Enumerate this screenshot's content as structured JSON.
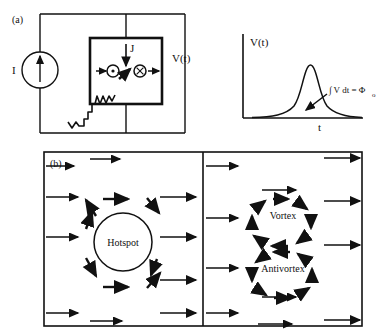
{
  "figure": {
    "panels": [
      {
        "id": "a",
        "label": "(a)",
        "circuit": {
          "current_source_label": "I",
          "current_source_icon": "current-source-arrow-up-icon",
          "voltage_label": "V(t)",
          "current_density_label": "J",
          "current_density_icon": "arrow-down-icon",
          "vortex_marker": "vortex-dot-icon",
          "antivortex_marker": "antivortex-cross-icon",
          "vortex_motion_icon": "arrow-right-icon",
          "antivortex_motion_icon": "arrow-right-icon",
          "phase_slip_icon": "squiggly-line-icon"
        },
        "plot": {
          "ylabel": "V(t)",
          "xlabel": "t",
          "annotation": "∫ V dt = Φ",
          "annotation_subscript": "o",
          "annotation_pointer_icon": "arrow-pointer-icon",
          "curve_type": "single-pulse-peak"
        }
      },
      {
        "id": "b",
        "label": "(b)",
        "left_scene": {
          "center_label": "Hotspot",
          "flow_arrow_icon": "arrow-right-icon",
          "circulation_arrow_icon": "curved-flow-arrow-icon",
          "bias_arrow_count": 6,
          "circulation_arrow_count": 8
        },
        "right_scene": {
          "top_label": "Vortex",
          "bottom_label": "Antivortex",
          "top_rotation": "clockwise",
          "bottom_rotation": "counter-clockwise",
          "flow_arrow_icon": "arrow-right-icon",
          "circulation_arrow_icon": "curved-flow-arrow-icon",
          "bias_arrow_count": 6
        }
      }
    ]
  },
  "colors": {
    "ink": "#111111",
    "background": "#ffffff"
  }
}
